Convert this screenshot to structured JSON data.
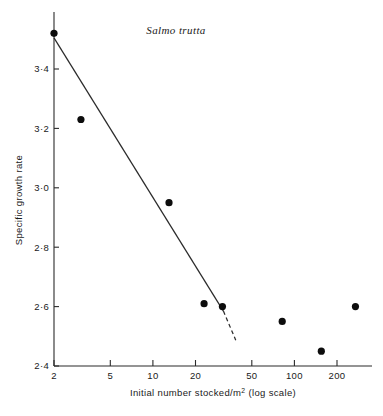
{
  "chart_data": {
    "type": "scatter",
    "title": "Salmo trutta",
    "xlabel": "Initial number stocked/m² (log scale)",
    "xlabel_main": "Initial number stocked/m",
    "xlabel_sup": "2",
    "xlabel_tail": " (log scale)",
    "ylabel": "Specific growth rate",
    "xscale": "log",
    "yscale": "linear",
    "xlim": [
      2,
      310
    ],
    "ylim": [
      2.4,
      3.56
    ],
    "grid": false,
    "legend": null,
    "xticks": [
      2,
      5,
      10,
      20,
      50,
      100,
      200
    ],
    "xtick_labels": [
      "2",
      "5",
      "10",
      "20",
      "50",
      "100",
      "200"
    ],
    "yticks": [
      2.4,
      2.6,
      2.8,
      3.0,
      3.2,
      3.4
    ],
    "ytick_labels": [
      "2·4",
      "2·6",
      "2·8",
      "3·0",
      "3·2",
      "3·4"
    ],
    "points": [
      {
        "x": 2.0,
        "y": 3.52
      },
      {
        "x": 3.1,
        "y": 3.23
      },
      {
        "x": 13.0,
        "y": 2.95
      },
      {
        "x": 23.0,
        "y": 2.61
      },
      {
        "x": 31.0,
        "y": 2.6
      },
      {
        "x": 82.0,
        "y": 2.55
      },
      {
        "x": 155.0,
        "y": 2.45
      },
      {
        "x": 270.0,
        "y": 2.6
      }
    ],
    "fit_line": {
      "solid": {
        "x1": 2.0,
        "y1": 3.505,
        "x2": 31.5,
        "y2": 2.585
      },
      "dashed": {
        "x1": 31.5,
        "y1": 2.585,
        "x2": 38.5,
        "y2": 2.487
      }
    },
    "colors": {
      "marker": "#0d0d0d",
      "line": "#2b2b2b",
      "axis": "#2b2b2b",
      "background": "#ffffff",
      "text": "#1a1a1a"
    }
  }
}
